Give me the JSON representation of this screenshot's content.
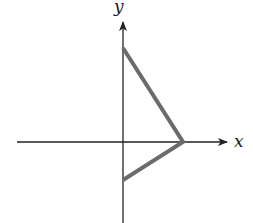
{
  "diagram": {
    "axes": {
      "x_label": "x",
      "y_label": "y",
      "color": "#222222"
    },
    "graph": {
      "type": "piecewise-linear",
      "description": "Two line segments meeting on the positive x-axis: from a positive y-intercept down to an x-intercept, then to a negative y-intercept",
      "color": "#6b6b6b",
      "points": [
        {
          "name": "top-y-intercept",
          "x": 123,
          "y": 48
        },
        {
          "name": "x-intercept-vertex",
          "x": 183,
          "y": 142
        },
        {
          "name": "bottom-y-intercept",
          "x": 123,
          "y": 180
        }
      ]
    }
  }
}
